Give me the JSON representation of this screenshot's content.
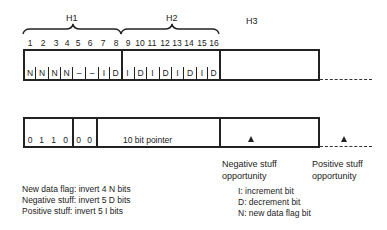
{
  "headers": {
    "h1": "H1",
    "h2": "H2",
    "h3": "H3"
  },
  "bit_numbers": [
    "1",
    "2",
    "3",
    "4",
    "5",
    "6",
    "7",
    "8",
    "9",
    "10",
    "11",
    "12",
    "13",
    "14",
    "15",
    "16"
  ],
  "top_bits": [
    "N",
    "N",
    "N",
    "N",
    "–",
    "–",
    "I",
    "D",
    "I",
    "D",
    "I",
    "D",
    "I",
    "D",
    "I",
    "D"
  ],
  "bottom_bits": [
    "0",
    "1",
    "1",
    "0",
    "0",
    "0"
  ],
  "pointer_label": "10 bit pointer",
  "negative_stuff": {
    "line1": "Negative stuff",
    "line2": "opportunity"
  },
  "positive_stuff": {
    "line1": "Positive stuff",
    "line2": "opportunity"
  },
  "notes_left": [
    "New data flag: invert 4 N bits",
    "Negative stuff: invert 5 D bits",
    "Positive stuff: invert 5 I bits"
  ],
  "notes_right": [
    "I: increment bit",
    "D: decrement bit",
    "N: new data flag bit"
  ]
}
